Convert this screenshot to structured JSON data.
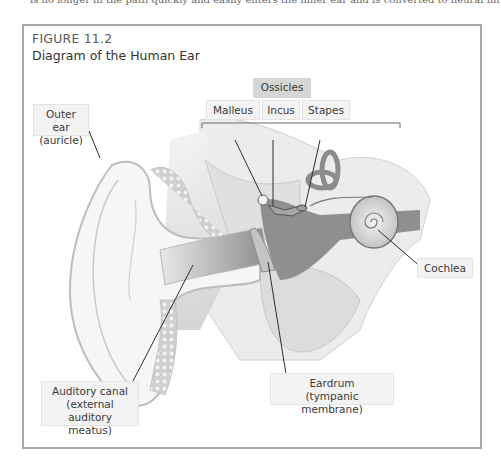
{
  "cut_off_text": "is no longer in the path quickly and easily enters the inner ear and is converted to neural impulses, the sound that travels",
  "figure": {
    "number": "FIGURE 11.2",
    "title": "Diagram of the Human Ear"
  },
  "labels": {
    "ossicles_group": "Ossicles",
    "malleus": "Malleus",
    "incus": "Incus",
    "stapes": "Stapes",
    "outer_ear_line1": "Outer ear",
    "outer_ear_line2": "(auricle)",
    "cochlea": "Cochlea",
    "auditory_canal_line1": "Auditory canal",
    "auditory_canal_line2": "(external auditory",
    "auditory_canal_line3": "meatus)",
    "eardrum_line1": "Eardrum",
    "eardrum_line2": "(tympanic membrane)"
  },
  "colors": {
    "frame": "#a9a9a9",
    "label_bg": "#f3f3f3",
    "ossicles_bg": "#d6d6d6",
    "illustration_gray": "#8a8a8a"
  }
}
